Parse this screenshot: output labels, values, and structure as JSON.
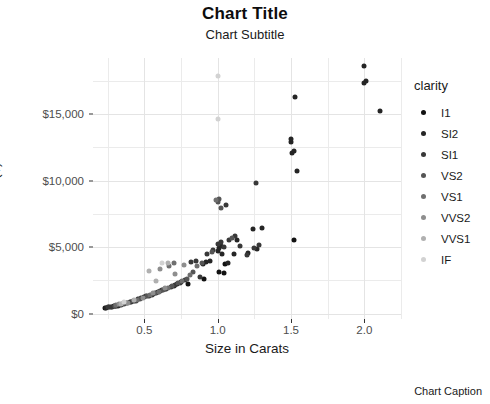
{
  "chart_data": {
    "type": "scatter",
    "title": "Chart Title",
    "subtitle": "Chart Subtitle",
    "caption": "Chart Caption",
    "xlabel": "Size in Carats",
    "ylabel": "Price ($)",
    "xlim": [
      0.15,
      2.25
    ],
    "ylim": [
      -400,
      19200
    ],
    "xticks": [
      0.5,
      1.0,
      1.5,
      2.0
    ],
    "xticklabels": [
      "0.5",
      "1.0",
      "1.5",
      "2.0"
    ],
    "yticks": [
      0,
      5000,
      10000,
      15000
    ],
    "yticklabels": [
      "$0",
      "$5,000",
      "$10,000",
      "$15,000"
    ],
    "x_minor_ticks": [
      0.25,
      0.75,
      1.25,
      1.75,
      2.25
    ],
    "y_minor_ticks": [
      2500,
      7500,
      12500,
      17500
    ],
    "grid": true,
    "legend": {
      "title": "clarity",
      "position": "right",
      "entries": [
        {
          "label": "I1",
          "color": "#121212"
        },
        {
          "label": "SI2",
          "color": "#252525"
        },
        {
          "label": "SI1",
          "color": "#383838"
        },
        {
          "label": "VS2",
          "color": "#555555"
        },
        {
          "label": "VS1",
          "color": "#6f6f6f"
        },
        {
          "label": "VVS2",
          "color": "#8e8e8e"
        },
        {
          "label": "VVS1",
          "color": "#b0b0b0"
        },
        {
          "label": "IF",
          "color": "#d2d2d2"
        }
      ]
    },
    "series": [
      {
        "name": "I1",
        "color": "#121212",
        "points": [
          [
            0.23,
            430
          ],
          [
            0.26,
            480
          ],
          [
            0.29,
            540
          ],
          [
            0.31,
            580
          ],
          [
            0.72,
            2230
          ],
          [
            0.75,
            2360
          ],
          [
            0.91,
            2620
          ],
          [
            1.01,
            3100
          ],
          [
            1.52,
            5550
          ],
          [
            1.04,
            3050
          ],
          [
            0.8,
            2240
          ],
          [
            1.05,
            3700
          ]
        ]
      },
      {
        "name": "SI2",
        "color": "#252525",
        "points": [
          [
            0.24,
            450
          ],
          [
            0.27,
            500
          ],
          [
            0.3,
            560
          ],
          [
            0.32,
            610
          ],
          [
            0.34,
            680
          ],
          [
            0.38,
            790
          ],
          [
            0.41,
            880
          ],
          [
            0.43,
            950
          ],
          [
            0.46,
            1090
          ],
          [
            0.5,
            1220
          ],
          [
            0.53,
            1360
          ],
          [
            0.56,
            1480
          ],
          [
            0.59,
            1600
          ],
          [
            0.62,
            1760
          ],
          [
            0.65,
            1880
          ],
          [
            0.7,
            2080
          ],
          [
            0.9,
            3740
          ],
          [
            0.92,
            3850
          ],
          [
            0.95,
            3990
          ],
          [
            1.0,
            4700
          ],
          [
            1.01,
            4950
          ],
          [
            1.02,
            5050
          ],
          [
            1.03,
            4450
          ],
          [
            1.07,
            3790
          ],
          [
            1.11,
            4500
          ],
          [
            1.13,
            5560
          ],
          [
            1.21,
            4550
          ],
          [
            1.24,
            6350
          ],
          [
            1.27,
            4830
          ],
          [
            1.3,
            6450
          ],
          [
            1.5,
            12900
          ],
          [
            1.5,
            13150
          ],
          [
            1.51,
            12100
          ],
          [
            1.52,
            12250
          ],
          [
            1.54,
            10750
          ],
          [
            1.53,
            16250
          ],
          [
            2.01,
            17500
          ],
          [
            2.0,
            17350
          ],
          [
            2.0,
            18600
          ],
          [
            2.11,
            15200
          ]
        ]
      },
      {
        "name": "SI1",
        "color": "#383838",
        "points": [
          [
            0.25,
            470
          ],
          [
            0.28,
            520
          ],
          [
            0.33,
            650
          ],
          [
            0.36,
            730
          ],
          [
            0.4,
            850
          ],
          [
            0.44,
            980
          ],
          [
            0.48,
            1150
          ],
          [
            0.51,
            1290
          ],
          [
            0.55,
            1430
          ],
          [
            0.58,
            1560
          ],
          [
            0.61,
            1700
          ],
          [
            0.64,
            1830
          ],
          [
            0.68,
            1990
          ],
          [
            0.71,
            2150
          ],
          [
            0.74,
            2300
          ],
          [
            0.78,
            2550
          ],
          [
            0.82,
            3850
          ],
          [
            0.85,
            3950
          ],
          [
            0.88,
            2780
          ],
          [
            0.93,
            4480
          ],
          [
            0.97,
            4750
          ],
          [
            1.0,
            5200
          ],
          [
            1.02,
            5350
          ],
          [
            1.04,
            5000
          ],
          [
            1.08,
            5500
          ],
          [
            1.12,
            5800
          ],
          [
            1.15,
            5050
          ],
          [
            1.2,
            4400
          ],
          [
            1.25,
            4950
          ],
          [
            1.28,
            5150
          ],
          [
            1.26,
            9800
          ],
          [
            1.06,
            8150
          ]
        ]
      },
      {
        "name": "VS2",
        "color": "#555555",
        "points": [
          [
            0.3,
            600
          ],
          [
            0.35,
            720
          ],
          [
            0.42,
            920
          ],
          [
            0.47,
            1130
          ],
          [
            0.52,
            1330
          ],
          [
            0.57,
            1520
          ],
          [
            0.63,
            1790
          ],
          [
            0.69,
            2060
          ],
          [
            0.73,
            2270
          ],
          [
            0.79,
            2620
          ],
          [
            0.83,
            3100
          ],
          [
            0.89,
            3800
          ],
          [
            0.96,
            4600
          ],
          [
            1.0,
            8350
          ],
          [
            1.01,
            8600
          ],
          [
            1.02,
            7950
          ],
          [
            1.1,
            5700
          ]
        ]
      },
      {
        "name": "VS1",
        "color": "#6f6f6f",
        "points": [
          [
            0.31,
            640
          ],
          [
            0.37,
            790
          ],
          [
            0.45,
            1030
          ],
          [
            0.54,
            1400
          ],
          [
            0.6,
            1660
          ],
          [
            0.66,
            1920
          ],
          [
            0.76,
            2450
          ],
          [
            0.81,
            2900
          ],
          [
            0.86,
            3600
          ],
          [
            0.99,
            8500
          ],
          [
            0.7,
            3780
          ],
          [
            0.67,
            3600
          ]
        ]
      },
      {
        "name": "VVS2",
        "color": "#8e8e8e",
        "points": [
          [
            0.33,
            700
          ],
          [
            0.39,
            830
          ],
          [
            0.49,
            1200
          ],
          [
            0.56,
            1550
          ],
          [
            0.64,
            1950
          ],
          [
            0.71,
            2950
          ],
          [
            0.77,
            3650
          ],
          [
            0.61,
            3350
          ]
        ]
      },
      {
        "name": "VVS1",
        "color": "#b0b0b0",
        "points": [
          [
            0.34,
            760
          ],
          [
            0.43,
            1020
          ],
          [
            0.58,
            2480
          ],
          [
            0.66,
            3780
          ],
          [
            0.53,
            3200
          ]
        ]
      },
      {
        "name": "IF",
        "color": "#d2d2d2",
        "points": [
          [
            0.36,
            860
          ],
          [
            0.62,
            3800
          ],
          [
            1.0,
            17850
          ],
          [
            1.0,
            14600
          ]
        ]
      }
    ]
  }
}
